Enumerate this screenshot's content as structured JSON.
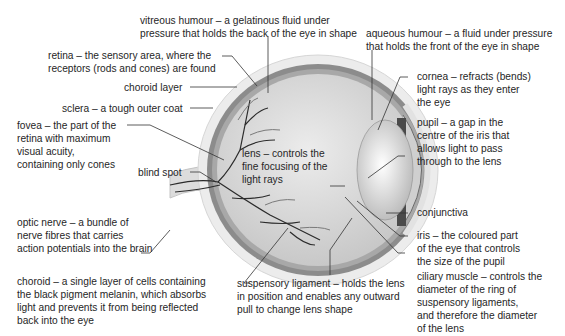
{
  "diagram": {
    "labels": {
      "vitreous_humour": [
        "vitreous humour – a gelatinous fluid under",
        "pressure that holds the back of the eye in shape"
      ],
      "aqueous_humour": [
        "aqueous humour – a fluid under pressure",
        "that holds the front of the eye in shape"
      ],
      "retina": [
        "retina – the sensory area, where the",
        "receptors (rods and cones) are found"
      ],
      "choroid_layer": [
        "choroid layer"
      ],
      "sclera": [
        "sclera – a tough outer coat"
      ],
      "cornea": [
        "cornea – refracts (bends)",
        "light rays as they enter",
        "the eye"
      ],
      "fovea": [
        "fovea – the part of the",
        "retina with maximum",
        "visual acuity,",
        "containing only cones"
      ],
      "pupil": [
        "pupil – a gap in the",
        "centre of the iris that",
        "allows light to pass",
        "through to the lens"
      ],
      "blind_spot": [
        "blind spot"
      ],
      "lens": [
        "lens – controls the",
        "fine focusing of the",
        "light rays"
      ],
      "conjunctiva": [
        "conjunctiva"
      ],
      "iris": [
        "iris – the coloured part",
        "of the eye that controls",
        "the size of the pupil"
      ],
      "optic_nerve": [
        "optic nerve – a bundle of",
        "nerve fibres that carries",
        "action potentials into the brain"
      ],
      "ciliary_muscle": [
        "ciliary muscle – controls the",
        "diameter of the ring of",
        "suspensory ligaments,",
        "and therefore the diameter",
        "of the lens"
      ],
      "choroid": [
        "choroid – a single layer of cells containing",
        "the black pigment melanin, which absorbs",
        "light and prevents it from being reflected",
        "back into the eye"
      ],
      "suspensory_ligament": [
        "suspensory ligament – holds the lens",
        "in position and enables any outward",
        "pull to change lens shape"
      ]
    },
    "colors": {
      "sclera": "#e6e6e6",
      "choroid": "#8f8f8f",
      "vitreous": "#d2d2d2",
      "vessels": "#2b2b2b",
      "iris": "#4a4a4a",
      "leader_lines": "#333333"
    }
  }
}
